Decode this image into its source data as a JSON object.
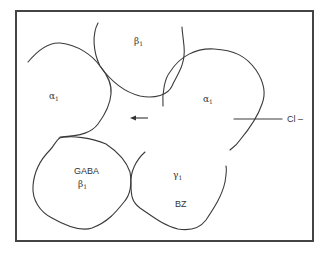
{
  "diagram": {
    "type": "GABA-A receptor subunit schematic",
    "colors": {
      "stroke": "#3a3a3a",
      "frame": "#444444",
      "text": "#333333",
      "background": "#ffffff"
    },
    "subunits": [
      {
        "id": "alpha-left",
        "symbol": "α",
        "subscript": "1"
      },
      {
        "id": "beta-top",
        "symbol": "β",
        "subscript": "1"
      },
      {
        "id": "alpha-right",
        "symbol": "α",
        "subscript": "1"
      },
      {
        "id": "beta-gaba",
        "site_label": "GABA",
        "symbol": "β",
        "subscript": "1"
      },
      {
        "id": "gamma-bz",
        "symbol": "γ",
        "subscript": "1",
        "site_label": "BZ"
      }
    ],
    "ion": {
      "label": "Cl –"
    },
    "flow_arrow": {
      "direction": "left"
    }
  }
}
